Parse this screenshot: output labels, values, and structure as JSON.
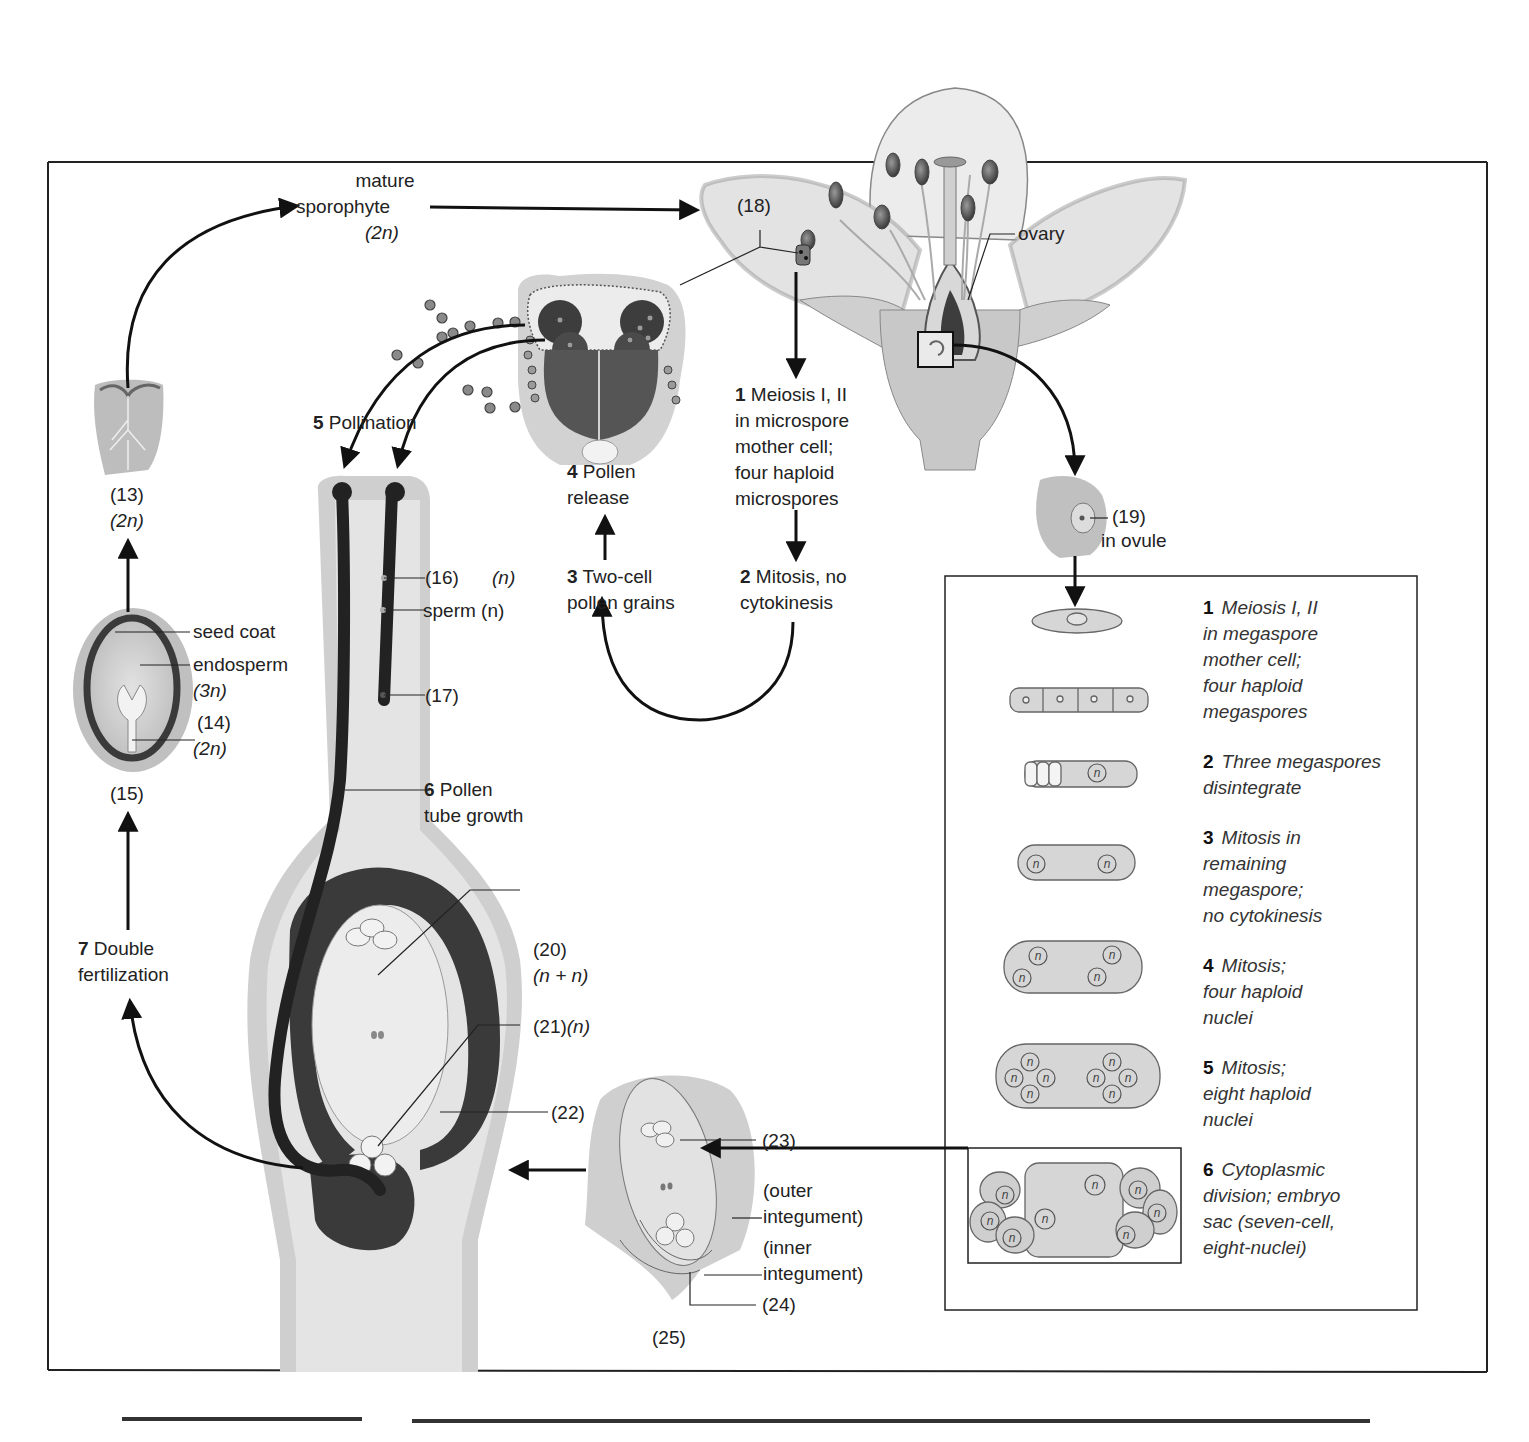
{
  "diagram": {
    "type": "life-cycle"
  },
  "cycle_labels": {
    "mature_sporophyte": {
      "line1": "mature",
      "line2": "sporophyte",
      "ploidy": "(2n)"
    },
    "label_18": "(18)",
    "ovary": "ovary",
    "micro_step1": {
      "num": "1",
      "lines": [
        "Meiosis I, II",
        "in microspore",
        "mother cell;",
        "four haploid",
        "microspores"
      ]
    },
    "micro_step2": {
      "num": "2",
      "lines": [
        "Mitosis, no",
        "cytokinesis"
      ]
    },
    "micro_step3": {
      "num": "3",
      "lines": [
        "Two-cell",
        "pollen grains"
      ]
    },
    "micro_step4": {
      "num": "4",
      "lines": [
        "Pollen",
        "release"
      ]
    },
    "step5": {
      "num": "5",
      "text": "Pollination"
    },
    "step6": {
      "num": "6",
      "lines": [
        "Pollen",
        "tube growth"
      ]
    },
    "step7": {
      "num": "7",
      "lines": [
        "Double",
        "fertilization"
      ]
    },
    "label_13": "(13)",
    "label_13_ploidy": "(2n)",
    "seed_coat": "seed coat",
    "endosperm": "endosperm",
    "endosperm_ploidy": "(3n)",
    "label_14": "(14)",
    "label_14_ploidy": "(2n)",
    "label_15": "(15)",
    "label_16": "(16)",
    "label_16_ploidy": "(n)",
    "sperm": "sperm (n)",
    "label_17": "(17)",
    "label_19": "(19)",
    "in_ovule": "in ovule",
    "label_20": "(20)",
    "label_20_ploidy": "(n + n)",
    "label_21": "(21)",
    "label_21_ploidy": "(n)",
    "label_22": "(22)",
    "label_23": "(23)",
    "outer_integument": [
      "(outer",
      "integument)"
    ],
    "inner_integument": [
      "(inner",
      "integument)"
    ],
    "label_24": "(24)",
    "label_25": "(25)"
  },
  "megaspore_panel": {
    "steps": [
      {
        "num": "1",
        "lines": [
          "Meiosis I, II",
          "in megaspore",
          "mother cell;",
          "four haploid",
          "megaspores"
        ]
      },
      {
        "num": "2",
        "lines": [
          "Three megaspores",
          "disintegrate"
        ]
      },
      {
        "num": "3",
        "lines": [
          "Mitosis in",
          "remaining",
          "megaspore;",
          "no cytokinesis"
        ]
      },
      {
        "num": "4",
        "lines": [
          "Mitosis;",
          "four haploid",
          "nuclei"
        ]
      },
      {
        "num": "5",
        "lines": [
          "Mitosis;",
          "eight haploid",
          "nuclei"
        ]
      },
      {
        "num": "6",
        "lines": [
          "Cytoplasmic",
          "division; embryo",
          "sac (seven-cell,",
          "eight-nuclei)"
        ]
      }
    ],
    "nucleus_glyph": "n"
  },
  "colors": {
    "ink": "#1a1a1a",
    "tissue_light": "#d9d9d9",
    "tissue_mid": "#b3b3b3",
    "tissue_dark": "#3a3a3a",
    "frame": "#222222"
  }
}
